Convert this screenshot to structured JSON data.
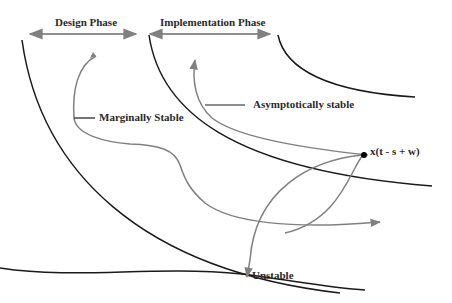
{
  "diagram": {
    "phases": {
      "design": {
        "label": "Design Phase"
      },
      "implementation": {
        "label": "Implementation Phase"
      }
    },
    "trajectories": {
      "marginally_stable": {
        "label": "Marginally Stable"
      },
      "asymptotically_stable": {
        "label": "Asymptotically stable"
      },
      "unstable": {
        "label": "Unstable"
      }
    },
    "point": {
      "label": "x(t - s + w)"
    },
    "colors": {
      "boundary": "#1a1a1a",
      "trajectory": "#808080",
      "text": "#2a2a2a"
    }
  }
}
